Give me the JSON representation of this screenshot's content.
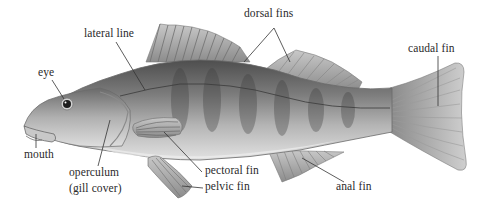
{
  "diagram": {
    "colors": {
      "background": "#ffffff",
      "label_text": "#2a2a2a",
      "leader_line": "#333333",
      "body_dark": "#5a5a5a",
      "body_mid": "#9a9a9a",
      "body_light": "#d8d8d8",
      "fin": "#b8b8b8"
    },
    "labels": {
      "lateral_line": "lateral line",
      "eye": "eye",
      "dorsal_fins": "dorsal fins",
      "caudal_fin": "caudal fin",
      "mouth": "mouth",
      "operculum": "operculum",
      "gill_cover": "(gill cover)",
      "pectoral_fin": "pectoral fin",
      "pelvic_fin": "pelvic fin",
      "anal_fin": "anal fin"
    }
  }
}
